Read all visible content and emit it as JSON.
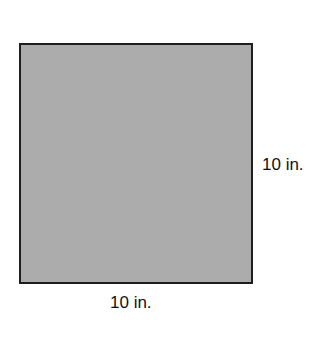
{
  "diagram": {
    "shape": "square",
    "fill_color": "#acacac",
    "border_color": "#1e1e1e",
    "side_label_right": "10 in.",
    "side_label_bottom": "10 in."
  }
}
